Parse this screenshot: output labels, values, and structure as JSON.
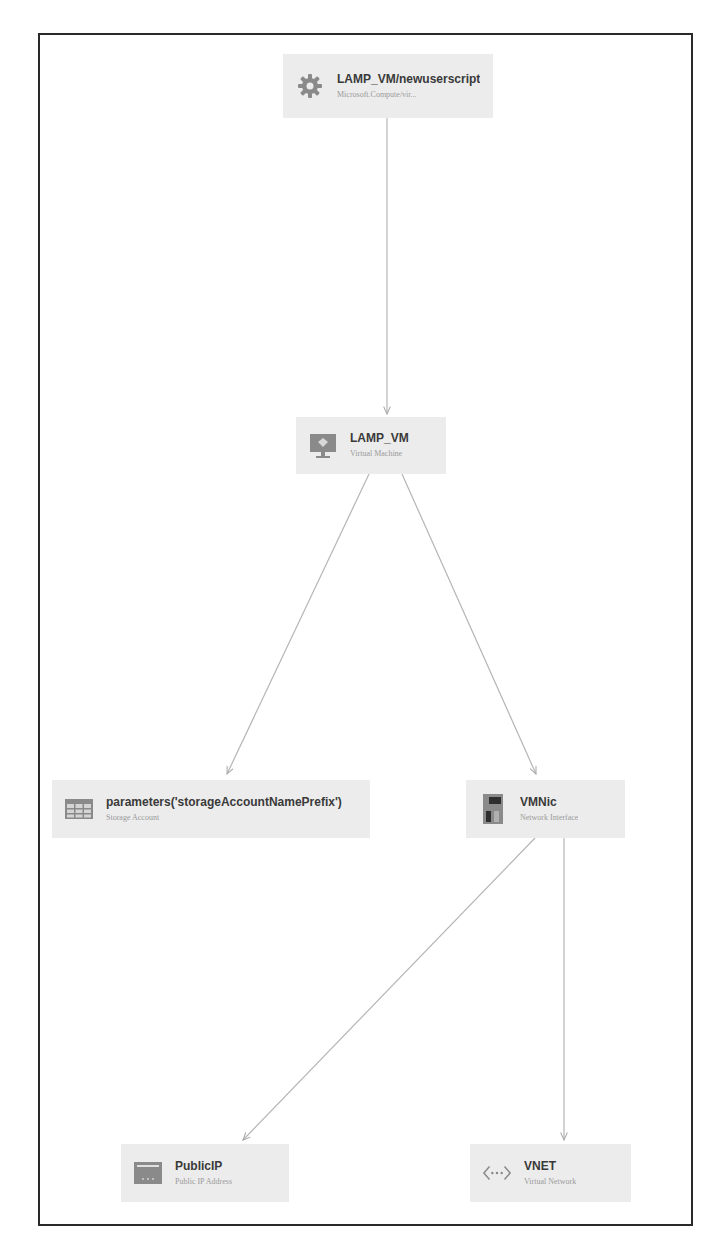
{
  "diagram": {
    "type": "resource-dependency-graph",
    "colors": {
      "frame_border": "#2a2a2a",
      "node_bg": "#ececec",
      "edge": "#b5b5b5",
      "title_text": "#3a3a3a",
      "subtitle_text": "#9a9a9a",
      "icon_fill": "#8a8a8a"
    },
    "nodes": [
      {
        "id": "script",
        "title": "LAMP_VM/newuserscript",
        "subtitle": "Microsoft.Compute/vir...",
        "icon": "gear-icon"
      },
      {
        "id": "vm",
        "title": "LAMP_VM",
        "subtitle": "Virtual Machine",
        "icon": "virtual-machine-icon"
      },
      {
        "id": "storage",
        "title": "parameters('storageAccountNamePrefix')",
        "subtitle": "Storage Account",
        "icon": "storage-table-icon"
      },
      {
        "id": "nic",
        "title": "VMNic",
        "subtitle": "Network Interface",
        "icon": "network-interface-icon"
      },
      {
        "id": "pip",
        "title": "PublicIP",
        "subtitle": "Public IP Address",
        "icon": "public-ip-icon"
      },
      {
        "id": "vnet",
        "title": "VNET",
        "subtitle": "Virtual Network",
        "icon": "virtual-network-icon"
      }
    ],
    "edges": [
      {
        "from": "script",
        "to": "vm"
      },
      {
        "from": "vm",
        "to": "storage"
      },
      {
        "from": "vm",
        "to": "nic"
      },
      {
        "from": "nic",
        "to": "pip"
      },
      {
        "from": "nic",
        "to": "vnet"
      }
    ]
  }
}
